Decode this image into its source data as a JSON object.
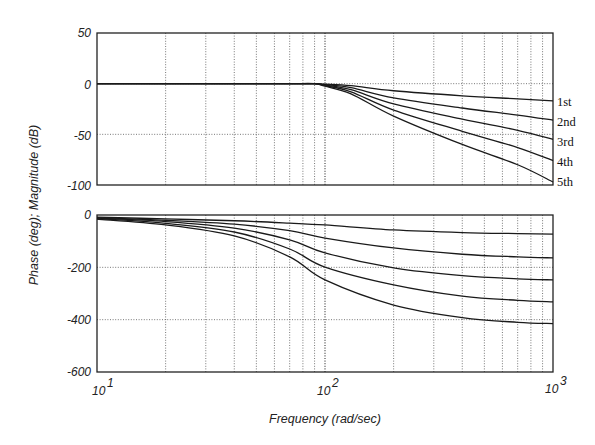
{
  "chart_data": [
    {
      "type": "line",
      "panel": "magnitude",
      "title": "",
      "xlabel": "Frequency (rad/sec)",
      "ylabel": "Phase (deg); Magnitude (dB)",
      "xscale": "log",
      "xlim": [
        10,
        1000
      ],
      "ylim": [
        -100,
        50
      ],
      "yticks": [
        50,
        0,
        -50,
        -100
      ],
      "grid": true,
      "x": [
        10,
        20,
        40,
        70,
        90,
        100,
        130,
        200,
        400,
        700,
        1000
      ],
      "series": [
        {
          "name": "1st",
          "values": [
            0,
            0,
            0,
            0,
            0,
            -0.5,
            -2,
            -7,
            -12,
            -15,
            -17
          ]
        },
        {
          "name": "2nd",
          "values": [
            0,
            0,
            0,
            0,
            0,
            -1,
            -4,
            -14,
            -24,
            -31,
            -36
          ]
        },
        {
          "name": "3rd",
          "values": [
            0,
            0,
            0,
            0,
            0,
            -1.5,
            -6,
            -20,
            -35,
            -46,
            -55
          ]
        },
        {
          "name": "4th",
          "values": [
            0,
            0,
            0,
            0,
            0,
            -2,
            -8,
            -26,
            -47,
            -63,
            -76
          ]
        },
        {
          "name": "5th",
          "values": [
            0,
            0,
            0,
            0,
            0,
            -2.5,
            -10,
            -32,
            -60,
            -80,
            -97
          ]
        }
      ],
      "legend_position": "right, inline at line ends"
    },
    {
      "type": "line",
      "panel": "phase",
      "title": "",
      "xlabel": "Frequency (rad/sec)",
      "ylabel": "Phase (deg); Magnitude (dB)",
      "xscale": "log",
      "xlim": [
        10,
        1000
      ],
      "ylim": [
        -600,
        0
      ],
      "yticks": [
        0,
        -200,
        -400,
        -600
      ],
      "xticks": [
        "10^1",
        "10^2",
        "10^3"
      ],
      "grid": true,
      "x": [
        10,
        20,
        40,
        70,
        100,
        200,
        400,
        700,
        1000
      ],
      "series": [
        {
          "name": "1st",
          "values": [
            -8,
            -15,
            -22,
            -31,
            -38,
            -57,
            -67,
            -71,
            -73
          ]
        },
        {
          "name": "2nd",
          "values": [
            -10,
            -20,
            -35,
            -60,
            -88,
            -126,
            -150,
            -160,
            -164
          ]
        },
        {
          "name": "3rd",
          "values": [
            -12,
            -25,
            -50,
            -95,
            -145,
            -202,
            -232,
            -244,
            -248
          ]
        },
        {
          "name": "4th",
          "values": [
            -14,
            -32,
            -65,
            -130,
            -199,
            -267,
            -310,
            -326,
            -332
          ]
        },
        {
          "name": "5th",
          "values": [
            -16,
            -38,
            -80,
            -160,
            -248,
            -344,
            -392,
            -410,
            -415
          ]
        }
      ]
    }
  ],
  "labels": {
    "ylabel": "Phase (deg); Magnitude (dB)",
    "xlabel": "Frequency (rad/sec)",
    "mag_yticks": [
      "50",
      "0",
      "-50",
      "-100"
    ],
    "phase_yticks": [
      "0",
      "-200",
      "-400",
      "-600"
    ],
    "xticks": [
      {
        "base": "10",
        "exp": "1"
      },
      {
        "base": "10",
        "exp": "2"
      },
      {
        "base": "10",
        "exp": "3"
      }
    ],
    "legend": [
      "1st",
      "2nd",
      "3rd",
      "4th",
      "5th"
    ]
  }
}
